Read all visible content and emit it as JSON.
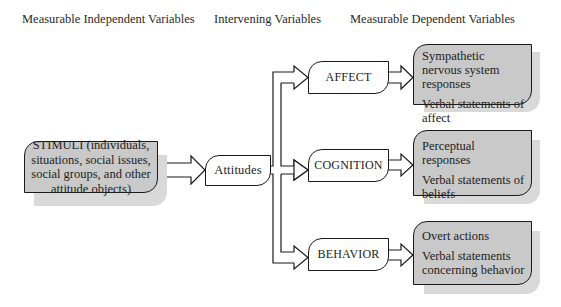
{
  "headers": {
    "independent": "Measurable Independent Variables",
    "intervening": "Intervening Variables",
    "dependent": "Measurable Dependent Variables"
  },
  "stimuli": {
    "label": "STIMULI (individuals, situations, social issues, social groups, and other attitude objects)"
  },
  "attitudes": {
    "label": "Attitudes"
  },
  "components": [
    {
      "label": "AFFECT",
      "responses": [
        "Sympathetic nervous system responses",
        "Verbal statements of affect"
      ]
    },
    {
      "label": "COGNITION",
      "responses": [
        "Perceptual responses",
        "Verbal statements of beliefs"
      ]
    },
    {
      "label": "BEHAVIOR",
      "responses": [
        "Overt actions",
        "Verbal statements concerning behavior"
      ]
    }
  ],
  "colors": {
    "box_fill": "#c9c9c9",
    "shadow": "#d9d9d9",
    "stroke": "#1a1a1a"
  }
}
